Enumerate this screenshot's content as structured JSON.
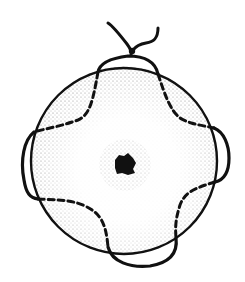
{
  "figure": {
    "colors": {
      "background": "#ffffff",
      "ink": "#111111",
      "stipple": "#555555"
    },
    "parts": [
      {
        "name": "sphere-outline"
      },
      {
        "name": "nucleus"
      },
      {
        "name": "stipple-shading"
      },
      {
        "name": "loop-solid"
      },
      {
        "name": "loop-dashed"
      },
      {
        "name": "top-knot"
      }
    ]
  }
}
